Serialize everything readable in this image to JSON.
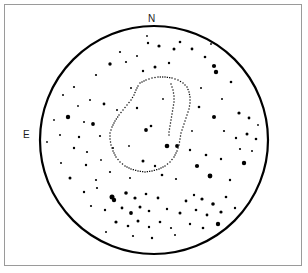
{
  "figure": {
    "background_color": "#ffffff",
    "frame_color": "#9a9a9a",
    "ink_color": "#000000"
  },
  "labels": {
    "north": "N",
    "east": "E"
  },
  "chart_data": {
    "type": "scatter",
    "title": "",
    "subtitle": "",
    "xlabel": "",
    "ylabel": "",
    "projection": "circular field of view",
    "grid": false,
    "legend_position": "none",
    "annotations": [
      {
        "text": "N",
        "position": "top",
        "x": 154,
        "y": 19
      },
      {
        "text": "E",
        "position": "left",
        "x": 27,
        "y": 135
      }
    ],
    "field_circle": {
      "center_x": 154,
      "center_y": 140,
      "radius": 114,
      "stroke_width": 2.2,
      "color": "#000000"
    },
    "contour": {
      "style": "dotted",
      "color": "#000000",
      "closed": true,
      "description": "pear/teardrop shaped dotted contour with narrow neck at top",
      "points": [
        [
          140,
          83
        ],
        [
          146,
          80
        ],
        [
          152,
          78
        ],
        [
          158,
          77
        ],
        [
          165,
          77
        ],
        [
          172,
          78
        ],
        [
          178,
          80
        ],
        [
          183,
          83
        ],
        [
          187,
          87
        ],
        [
          189,
          92
        ],
        [
          190,
          97
        ],
        [
          190,
          103
        ],
        [
          189,
          109
        ],
        [
          187,
          115
        ],
        [
          185,
          121
        ],
        [
          183,
          127
        ],
        [
          181,
          133
        ],
        [
          180,
          139
        ],
        [
          179,
          145
        ],
        [
          177,
          151
        ],
        [
          174,
          157
        ],
        [
          170,
          162
        ],
        [
          165,
          166
        ],
        [
          159,
          169
        ],
        [
          152,
          171
        ],
        [
          145,
          172
        ],
        [
          138,
          171
        ],
        [
          131,
          169
        ],
        [
          125,
          166
        ],
        [
          120,
          162
        ],
        [
          116,
          157
        ],
        [
          113,
          151
        ],
        [
          111,
          145
        ],
        [
          110,
          139
        ],
        [
          110,
          133
        ],
        [
          112,
          127
        ],
        [
          115,
          121
        ],
        [
          119,
          115
        ],
        [
          123,
          110
        ],
        [
          127,
          105
        ],
        [
          131,
          100
        ],
        [
          134,
          95
        ],
        [
          136,
          90
        ],
        [
          138,
          86
        ]
      ],
      "inner_points": [
        [
          171,
          84
        ],
        [
          173,
          90
        ],
        [
          174,
          96
        ],
        [
          174,
          102
        ],
        [
          173,
          108
        ],
        [
          172,
          114
        ],
        [
          171,
          120
        ],
        [
          170,
          126
        ],
        [
          169,
          132
        ],
        [
          169,
          138
        ]
      ]
    },
    "points": [
      {
        "x": 159,
        "y": 46,
        "size": 1.6
      },
      {
        "x": 174,
        "y": 49,
        "size": 1.5
      },
      {
        "x": 192,
        "y": 49,
        "size": 1.4
      },
      {
        "x": 120,
        "y": 52,
        "size": 1.1
      },
      {
        "x": 148,
        "y": 43,
        "size": 1.2
      },
      {
        "x": 180,
        "y": 42,
        "size": 1.3
      },
      {
        "x": 137,
        "y": 56,
        "size": 1.0
      },
      {
        "x": 205,
        "y": 57,
        "size": 1.3
      },
      {
        "x": 110,
        "y": 64,
        "size": 1.7
      },
      {
        "x": 126,
        "y": 62,
        "size": 1.1
      },
      {
        "x": 155,
        "y": 67,
        "size": 1.5
      },
      {
        "x": 169,
        "y": 63,
        "size": 1.2
      },
      {
        "x": 214,
        "y": 66,
        "size": 2.1
      },
      {
        "x": 216,
        "y": 72,
        "size": 2.2
      },
      {
        "x": 143,
        "y": 71,
        "size": 1.2
      },
      {
        "x": 96,
        "y": 75,
        "size": 1.1
      },
      {
        "x": 231,
        "y": 82,
        "size": 1.3
      },
      {
        "x": 63,
        "y": 95,
        "size": 1.0
      },
      {
        "x": 74,
        "y": 87,
        "size": 1.1
      },
      {
        "x": 90,
        "y": 100,
        "size": 1.0
      },
      {
        "x": 104,
        "y": 104,
        "size": 1.4
      },
      {
        "x": 117,
        "y": 110,
        "size": 1.0
      },
      {
        "x": 137,
        "y": 108,
        "size": 1.2
      },
      {
        "x": 199,
        "y": 107,
        "size": 1.3
      },
      {
        "x": 214,
        "y": 117,
        "size": 2.0
      },
      {
        "x": 239,
        "y": 113,
        "size": 1.6
      },
      {
        "x": 249,
        "y": 118,
        "size": 1.4
      },
      {
        "x": 68,
        "y": 117,
        "size": 2.2
      },
      {
        "x": 93,
        "y": 124,
        "size": 1.9
      },
      {
        "x": 60,
        "y": 135,
        "size": 1.0
      },
      {
        "x": 79,
        "y": 137,
        "size": 1.2
      },
      {
        "x": 100,
        "y": 136,
        "size": 1.1
      },
      {
        "x": 146,
        "y": 130,
        "size": 1.9
      },
      {
        "x": 151,
        "y": 126,
        "size": 1.3
      },
      {
        "x": 224,
        "y": 131,
        "size": 1.1
      },
      {
        "x": 236,
        "y": 138,
        "size": 1.2
      },
      {
        "x": 247,
        "y": 134,
        "size": 1.5
      },
      {
        "x": 256,
        "y": 139,
        "size": 1.3
      },
      {
        "x": 74,
        "y": 148,
        "size": 1.2
      },
      {
        "x": 87,
        "y": 152,
        "size": 1.1
      },
      {
        "x": 113,
        "y": 148,
        "size": 1.0
      },
      {
        "x": 167,
        "y": 146,
        "size": 2.3
      },
      {
        "x": 177,
        "y": 146,
        "size": 1.9
      },
      {
        "x": 190,
        "y": 150,
        "size": 1.2
      },
      {
        "x": 206,
        "y": 155,
        "size": 1.3
      },
      {
        "x": 221,
        "y": 159,
        "size": 1.2
      },
      {
        "x": 61,
        "y": 163,
        "size": 1.0
      },
      {
        "x": 86,
        "y": 165,
        "size": 1.2
      },
      {
        "x": 110,
        "y": 172,
        "size": 1.1
      },
      {
        "x": 143,
        "y": 161,
        "size": 1.5
      },
      {
        "x": 155,
        "y": 166,
        "size": 1.2
      },
      {
        "x": 197,
        "y": 166,
        "size": 2.1
      },
      {
        "x": 244,
        "y": 163,
        "size": 2.2
      },
      {
        "x": 70,
        "y": 178,
        "size": 1.5
      },
      {
        "x": 96,
        "y": 180,
        "size": 1.1
      },
      {
        "x": 130,
        "y": 178,
        "size": 1.0
      },
      {
        "x": 162,
        "y": 175,
        "size": 1.3
      },
      {
        "x": 176,
        "y": 179,
        "size": 1.1
      },
      {
        "x": 210,
        "y": 176,
        "size": 2.4
      },
      {
        "x": 230,
        "y": 180,
        "size": 1.2
      },
      {
        "x": 84,
        "y": 192,
        "size": 1.2
      },
      {
        "x": 97,
        "y": 188,
        "size": 1.1
      },
      {
        "x": 112,
        "y": 197,
        "size": 2.5
      },
      {
        "x": 114,
        "y": 200,
        "size": 2.2
      },
      {
        "x": 126,
        "y": 193,
        "size": 1.8
      },
      {
        "x": 135,
        "y": 198,
        "size": 1.6
      },
      {
        "x": 146,
        "y": 194,
        "size": 1.3
      },
      {
        "x": 158,
        "y": 198,
        "size": 1.4
      },
      {
        "x": 186,
        "y": 201,
        "size": 1.4
      },
      {
        "x": 194,
        "y": 195,
        "size": 1.2
      },
      {
        "x": 202,
        "y": 199,
        "size": 1.6
      },
      {
        "x": 213,
        "y": 204,
        "size": 1.8
      },
      {
        "x": 226,
        "y": 197,
        "size": 1.3
      },
      {
        "x": 91,
        "y": 206,
        "size": 1.1
      },
      {
        "x": 105,
        "y": 210,
        "size": 1.2
      },
      {
        "x": 122,
        "y": 208,
        "size": 1.4
      },
      {
        "x": 131,
        "y": 213,
        "size": 1.9
      },
      {
        "x": 140,
        "y": 207,
        "size": 1.5
      },
      {
        "x": 149,
        "y": 211,
        "size": 1.3
      },
      {
        "x": 167,
        "y": 209,
        "size": 1.2
      },
      {
        "x": 180,
        "y": 213,
        "size": 1.5
      },
      {
        "x": 196,
        "y": 210,
        "size": 1.3
      },
      {
        "x": 207,
        "y": 215,
        "size": 1.4
      },
      {
        "x": 221,
        "y": 212,
        "size": 1.6
      },
      {
        "x": 235,
        "y": 208,
        "size": 1.2
      },
      {
        "x": 116,
        "y": 222,
        "size": 1.6
      },
      {
        "x": 128,
        "y": 226,
        "size": 1.3
      },
      {
        "x": 138,
        "y": 221,
        "size": 1.5
      },
      {
        "x": 149,
        "y": 227,
        "size": 1.2
      },
      {
        "x": 160,
        "y": 222,
        "size": 1.3
      },
      {
        "x": 171,
        "y": 228,
        "size": 1.1
      },
      {
        "x": 190,
        "y": 224,
        "size": 1.2
      },
      {
        "x": 203,
        "y": 228,
        "size": 1.3
      },
      {
        "x": 218,
        "y": 224,
        "size": 2.2
      },
      {
        "x": 133,
        "y": 236,
        "size": 1.1
      },
      {
        "x": 152,
        "y": 238,
        "size": 1.2
      },
      {
        "x": 175,
        "y": 235,
        "size": 1.0
      },
      {
        "x": 106,
        "y": 232,
        "size": 1.0
      },
      {
        "x": 84,
        "y": 122,
        "size": 1.0
      },
      {
        "x": 131,
        "y": 88,
        "size": 1.0
      },
      {
        "x": 163,
        "y": 99,
        "size": 0.9
      },
      {
        "x": 201,
        "y": 88,
        "size": 1.0
      },
      {
        "x": 222,
        "y": 99,
        "size": 1.0
      },
      {
        "x": 240,
        "y": 149,
        "size": 1.1
      },
      {
        "x": 252,
        "y": 151,
        "size": 1.0
      },
      {
        "x": 192,
        "y": 131,
        "size": 0.9
      },
      {
        "x": 129,
        "y": 146,
        "size": 0.9
      },
      {
        "x": 101,
        "y": 160,
        "size": 0.9
      },
      {
        "x": 78,
        "y": 106,
        "size": 0.9
      },
      {
        "x": 147,
        "y": 36,
        "size": 0.9
      },
      {
        "x": 211,
        "y": 44,
        "size": 0.9
      },
      {
        "x": 258,
        "y": 125,
        "size": 0.9
      },
      {
        "x": 47,
        "y": 142,
        "size": 0.9
      },
      {
        "x": 54,
        "y": 120,
        "size": 0.9
      }
    ]
  }
}
